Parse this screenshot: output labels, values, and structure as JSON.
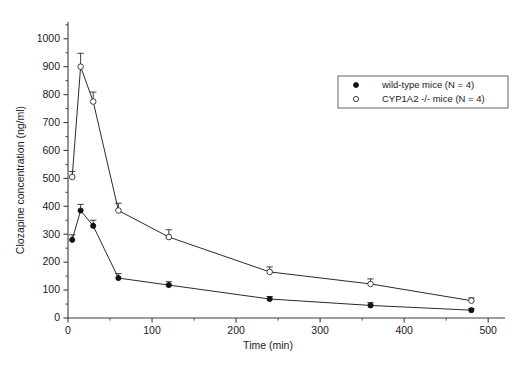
{
  "chart_data": {
    "type": "line",
    "title": "",
    "subtitle": "",
    "xlabel": "Time (min)",
    "ylabel": "Clozapine concentration (ng/ml)",
    "xlim": [
      0,
      520
    ],
    "ylim": [
      0,
      1060
    ],
    "xticks": [
      0,
      100,
      200,
      300,
      400,
      500
    ],
    "yticks": [
      0,
      100,
      200,
      300,
      400,
      500,
      600,
      700,
      800,
      900,
      1000
    ],
    "xticklabels": [
      "0",
      "100",
      "200",
      "300",
      "400",
      "500"
    ],
    "yticklabels": [
      "0",
      "100",
      "200",
      "300",
      "400",
      "500",
      "600",
      "700",
      "800",
      "900",
      "1000"
    ],
    "grid": false,
    "legend_position": "upper right",
    "x": [
      5,
      15,
      30,
      60,
      120,
      240,
      360,
      480
    ],
    "series": [
      {
        "name": "wild-type mice (N = 4)",
        "marker": "filled-circle",
        "values": [
          280,
          385,
          330,
          143,
          118,
          68,
          45,
          28
        ],
        "errors": [
          18,
          22,
          20,
          16,
          12,
          9,
          10,
          6
        ]
      },
      {
        "name": "CYP1A2 -/- mice (N = 4)",
        "marker": "open-circle",
        "values": [
          505,
          900,
          775,
          385,
          290,
          165,
          122,
          62
        ],
        "errors": [
          20,
          48,
          34,
          26,
          26,
          18,
          18,
          10
        ]
      }
    ],
    "legend": [
      {
        "label": "wild-type mice (N = 4)",
        "marker": "filled-circle"
      },
      {
        "label": "CYP1A2 -/- mice (N = 4)",
        "marker": "open-circle"
      }
    ]
  }
}
